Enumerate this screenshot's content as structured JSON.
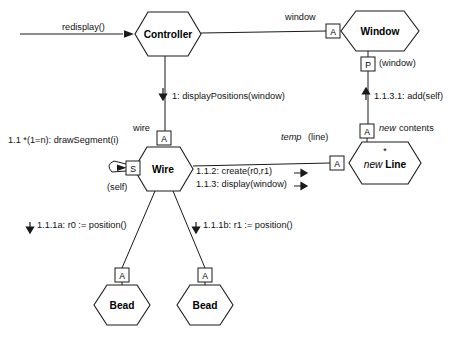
{
  "diagram": {
    "kind": "uml-collaboration-diagram",
    "background": "#ffffff",
    "stroke": "#1a1a1a",
    "text_color": "#111111",
    "nodes": [
      {
        "id": "controller",
        "label": "Controller",
        "italic_prefix": "",
        "cx": 168,
        "cy": 34,
        "w": 66,
        "h": 44
      },
      {
        "id": "window",
        "label": "Window",
        "italic_prefix": "",
        "cx": 380,
        "cy": 31,
        "w": 78,
        "h": 40
      },
      {
        "id": "wire",
        "label": "Wire",
        "italic_prefix": "",
        "cx": 163,
        "cy": 169,
        "w": 58,
        "h": 44
      },
      {
        "id": "line",
        "label": "Line",
        "italic_prefix": "new ",
        "cx": 385,
        "cy": 163,
        "w": 72,
        "h": 44
      },
      {
        "id": "bead-left",
        "label": "Bead",
        "italic_prefix": "",
        "cx": 122,
        "cy": 305,
        "w": 58,
        "h": 42
      },
      {
        "id": "bead-right",
        "label": "Bead",
        "italic_prefix": "",
        "cx": 205,
        "cy": 305,
        "w": 58,
        "h": 42
      }
    ],
    "role_boxes": [
      {
        "id": "window-a",
        "letter": "A",
        "x": 326,
        "y": 24,
        "w": 14,
        "h": 14
      },
      {
        "id": "window-p",
        "letter": "P",
        "x": 361,
        "y": 57,
        "w": 14,
        "h": 14
      },
      {
        "id": "wire-a",
        "letter": "A",
        "x": 157,
        "y": 131,
        "w": 14,
        "h": 14
      },
      {
        "id": "wire-s",
        "letter": "S",
        "x": 126,
        "y": 161,
        "w": 14,
        "h": 14
      },
      {
        "id": "line-a-left",
        "letter": "A",
        "x": 330,
        "y": 156,
        "w": 14,
        "h": 14
      },
      {
        "id": "line-a-top",
        "letter": "A",
        "x": 360,
        "y": 124,
        "w": 14,
        "h": 14
      },
      {
        "id": "bead-left-a",
        "letter": "A",
        "x": 115,
        "y": 268,
        "w": 14,
        "h": 14
      },
      {
        "id": "bead-right-a",
        "letter": "A",
        "x": 198,
        "y": 268,
        "w": 14,
        "h": 14
      }
    ],
    "labels": [
      {
        "id": "redisplay",
        "text": "redisplay()",
        "x": 62,
        "y": 23,
        "style": "plain"
      },
      {
        "id": "window-role",
        "text": "window",
        "x": 285,
        "y": 13,
        "style": "plain"
      },
      {
        "id": "window-param",
        "text": "(window)",
        "x": 379,
        "y": 59,
        "style": "plain"
      },
      {
        "id": "msg-1",
        "text": "1: displayPositions(window)",
        "x": 172,
        "y": 92,
        "style": "plain"
      },
      {
        "id": "msg-1131",
        "text": "1.1.3.1: add(self)",
        "x": 374,
        "y": 92,
        "style": "plain"
      },
      {
        "id": "wire-role",
        "text": "wire",
        "x": 133,
        "y": 124,
        "style": "plain"
      },
      {
        "id": "msg-11",
        "text": "1.1 *(1=n): drawSegment(i)",
        "x": 8,
        "y": 136,
        "style": "plain"
      },
      {
        "id": "line-temp-ital",
        "text": "temp",
        "x": 281,
        "y": 133,
        "style": "italic"
      },
      {
        "id": "line-temp-rest",
        "text": "(line)",
        "x": 308,
        "y": 133,
        "style": "plain"
      },
      {
        "id": "new-contents-it",
        "text": "new",
        "x": 379,
        "y": 124,
        "style": "italic"
      },
      {
        "id": "new-contents-rs",
        "text": "contents",
        "x": 399,
        "y": 124,
        "style": "plain"
      },
      {
        "id": "wire-self",
        "text": "(self)",
        "x": 107,
        "y": 183,
        "style": "plain"
      },
      {
        "id": "msg-112",
        "text": "1.1.2: create(r0,r1)",
        "x": 196,
        "y": 170,
        "style": "plain"
      },
      {
        "id": "msg-113",
        "text": "1.1.3: display(window)",
        "x": 196,
        "y": 183,
        "style": "plain"
      },
      {
        "id": "msg-111a",
        "text": "1.1.1a: r0 := position()",
        "x": 37,
        "y": 226,
        "style": "plain"
      },
      {
        "id": "msg-111b",
        "text": "1.1.1b: r1 := position()",
        "x": 203,
        "y": 226,
        "style": "plain"
      }
    ],
    "multiplicity_marks": [
      {
        "id": "line-star",
        "text": "*",
        "x": 385,
        "y": 150
      }
    ],
    "connectors": [
      {
        "id": "redisplay-arrow",
        "from": "external-left",
        "to": "controller"
      },
      {
        "id": "controller-window-link",
        "from": "controller",
        "to": "window-a"
      },
      {
        "id": "controller-wire-link",
        "from": "controller",
        "to": "wire-a"
      },
      {
        "id": "window-line-link",
        "from": "window-p",
        "to": "line-a-top"
      },
      {
        "id": "wire-line-link",
        "from": "wire",
        "to": "line-a-left"
      },
      {
        "id": "wire-self-loop",
        "from": "wire-s",
        "to": "wire-s"
      },
      {
        "id": "wire-beadleft-link",
        "from": "wire",
        "to": "bead-left-a"
      },
      {
        "id": "wire-beadright-link",
        "from": "wire",
        "to": "bead-right-a"
      }
    ],
    "message_arrows": [
      {
        "id": "arrow-msg-1",
        "direction": "down",
        "x": 166,
        "y": 92
      },
      {
        "id": "arrow-msg-1131",
        "direction": "up",
        "x": 368,
        "y": 92
      },
      {
        "id": "arrow-msg-112",
        "direction": "right",
        "x": 300,
        "y": 171
      },
      {
        "id": "arrow-msg-113",
        "direction": "right",
        "x": 300,
        "y": 184
      },
      {
        "id": "arrow-msg-111a",
        "direction": "down",
        "x": 31,
        "y": 226
      },
      {
        "id": "arrow-msg-111b",
        "direction": "down",
        "x": 197,
        "y": 226
      }
    ]
  }
}
